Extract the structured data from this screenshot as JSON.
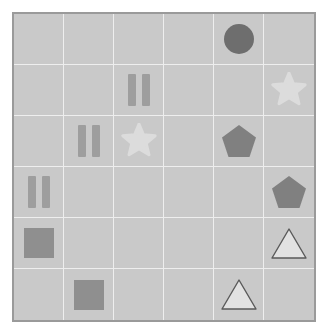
{
  "board": {
    "title": "shape-grid",
    "rows": 6,
    "cols": 6,
    "background_color": "#c9c9c9",
    "border_color": "#9a9a9a",
    "gridline_color": "#eeeeee"
  },
  "palette": {
    "dark_gray": "#6e6e6e",
    "mid_gray": "#8f8f8f",
    "light_gray": "#dcdcdc",
    "outline_gray": "#5a5a5a",
    "pale_fill": "#e2e2e2"
  },
  "cells": [
    {
      "row": 1,
      "col": 1,
      "shape": "empty",
      "name": "cell-r1c1",
      "color": ""
    },
    {
      "row": 1,
      "col": 2,
      "shape": "empty",
      "name": "cell-r1c2",
      "color": ""
    },
    {
      "row": 1,
      "col": 3,
      "shape": "empty",
      "name": "cell-r1c3",
      "color": ""
    },
    {
      "row": 1,
      "col": 4,
      "shape": "empty",
      "name": "cell-r1c4",
      "color": ""
    },
    {
      "row": 1,
      "col": 5,
      "shape": "circle",
      "name": "cell-r1c5",
      "color": "#6e6e6e"
    },
    {
      "row": 1,
      "col": 6,
      "shape": "empty",
      "name": "cell-r1c6",
      "color": ""
    },
    {
      "row": 2,
      "col": 1,
      "shape": "empty",
      "name": "cell-r2c1",
      "color": ""
    },
    {
      "row": 2,
      "col": 2,
      "shape": "empty",
      "name": "cell-r2c2",
      "color": ""
    },
    {
      "row": 2,
      "col": 3,
      "shape": "bars",
      "name": "cell-r2c3",
      "color": "#9e9e9e"
    },
    {
      "row": 2,
      "col": 4,
      "shape": "empty",
      "name": "cell-r2c4",
      "color": ""
    },
    {
      "row": 2,
      "col": 5,
      "shape": "empty",
      "name": "cell-r2c5",
      "color": ""
    },
    {
      "row": 2,
      "col": 6,
      "shape": "star",
      "name": "cell-r2c6",
      "color": "#dcdcdc"
    },
    {
      "row": 3,
      "col": 1,
      "shape": "empty",
      "name": "cell-r3c1",
      "color": ""
    },
    {
      "row": 3,
      "col": 2,
      "shape": "bars",
      "name": "cell-r3c2",
      "color": "#9e9e9e"
    },
    {
      "row": 3,
      "col": 3,
      "shape": "star",
      "name": "cell-r3c3",
      "color": "#dcdcdc"
    },
    {
      "row": 3,
      "col": 4,
      "shape": "empty",
      "name": "cell-r3c4",
      "color": ""
    },
    {
      "row": 3,
      "col": 5,
      "shape": "pentagon",
      "name": "cell-r3c5",
      "color": "#808080"
    },
    {
      "row": 3,
      "col": 6,
      "shape": "empty",
      "name": "cell-r3c6",
      "color": ""
    },
    {
      "row": 4,
      "col": 1,
      "shape": "bars",
      "name": "cell-r4c1",
      "color": "#9e9e9e"
    },
    {
      "row": 4,
      "col": 2,
      "shape": "empty",
      "name": "cell-r4c2",
      "color": ""
    },
    {
      "row": 4,
      "col": 3,
      "shape": "empty",
      "name": "cell-r4c3",
      "color": ""
    },
    {
      "row": 4,
      "col": 4,
      "shape": "empty",
      "name": "cell-r4c4",
      "color": ""
    },
    {
      "row": 4,
      "col": 5,
      "shape": "empty",
      "name": "cell-r4c5",
      "color": ""
    },
    {
      "row": 4,
      "col": 6,
      "shape": "pentagon",
      "name": "cell-r4c6",
      "color": "#808080"
    },
    {
      "row": 5,
      "col": 1,
      "shape": "square",
      "name": "cell-r5c1",
      "color": "#8f8f8f"
    },
    {
      "row": 5,
      "col": 2,
      "shape": "empty",
      "name": "cell-r5c2",
      "color": ""
    },
    {
      "row": 5,
      "col": 3,
      "shape": "empty",
      "name": "cell-r5c3",
      "color": ""
    },
    {
      "row": 5,
      "col": 4,
      "shape": "empty",
      "name": "cell-r5c4",
      "color": ""
    },
    {
      "row": 5,
      "col": 5,
      "shape": "empty",
      "name": "cell-r5c5",
      "color": ""
    },
    {
      "row": 5,
      "col": 6,
      "shape": "triangle",
      "name": "cell-r5c6",
      "color": "#e2e2e2"
    },
    {
      "row": 6,
      "col": 1,
      "shape": "empty",
      "name": "cell-r6c1",
      "color": ""
    },
    {
      "row": 6,
      "col": 2,
      "shape": "square",
      "name": "cell-r6c2",
      "color": "#8f8f8f"
    },
    {
      "row": 6,
      "col": 3,
      "shape": "empty",
      "name": "cell-r6c3",
      "color": ""
    },
    {
      "row": 6,
      "col": 4,
      "shape": "empty",
      "name": "cell-r6c4",
      "color": ""
    },
    {
      "row": 6,
      "col": 5,
      "shape": "triangle",
      "name": "cell-r6c5",
      "color": "#e2e2e2"
    },
    {
      "row": 6,
      "col": 6,
      "shape": "empty",
      "name": "cell-r6c6",
      "color": ""
    }
  ]
}
